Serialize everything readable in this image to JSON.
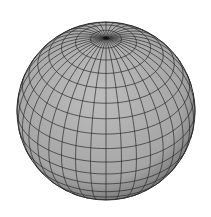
{
  "figure": {
    "fill_color": "#a9a9a9",
    "line_color": "#2a2a2a",
    "background": "#ffffff",
    "meridians": 36,
    "parallels": 18,
    "tilt_deg": 35
  }
}
